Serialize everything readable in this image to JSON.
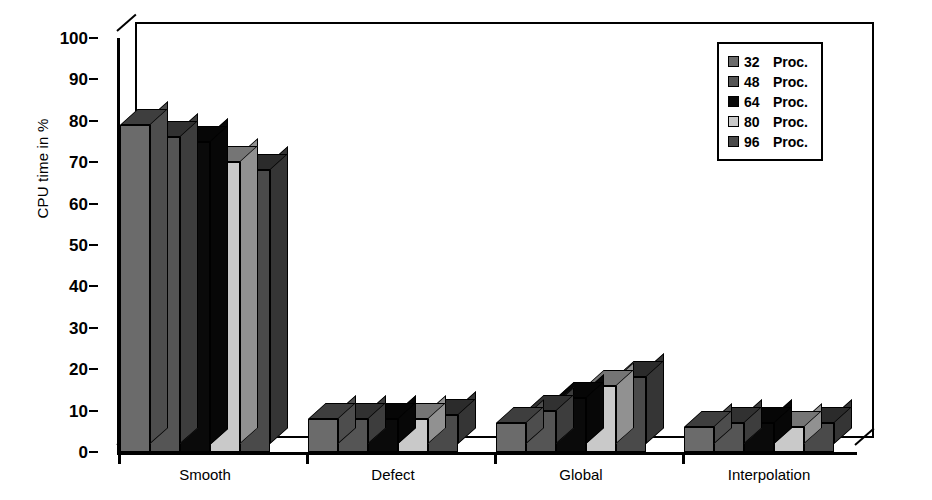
{
  "chart_data": {
    "type": "bar",
    "title": "",
    "subtitle": "",
    "xlabel": "",
    "ylabel": "CPU time in %",
    "ylim": [
      0,
      100
    ],
    "yticks": [
      0,
      10,
      20,
      30,
      40,
      50,
      60,
      70,
      80,
      90,
      100
    ],
    "ytick_labels": [
      "0",
      "10",
      "20",
      "30",
      "40",
      "50",
      "60",
      "70",
      "80",
      "90",
      "100"
    ],
    "grid": false,
    "style_3d": true,
    "legend_position": "top-right",
    "categories": [
      "Smooth",
      "Defect",
      "Global",
      "Interpolation"
    ],
    "series": [
      {
        "name": "32 Proc.",
        "color": "#6b6b6b",
        "values": [
          79,
          8,
          7,
          6
        ]
      },
      {
        "name": "48 Proc.",
        "color": "#555555",
        "values": [
          76,
          8,
          10,
          7
        ]
      },
      {
        "name": "64 Proc.",
        "color": "#0a0a0a",
        "values": [
          75,
          8,
          13,
          7
        ]
      },
      {
        "name": "80 Proc.",
        "color": "#c9c9c9",
        "values": [
          70,
          8,
          16,
          6
        ]
      },
      {
        "name": "96 Proc.",
        "color": "#4a4a4a",
        "values": [
          68,
          9,
          18,
          7
        ]
      }
    ],
    "annotations": []
  },
  "legend": {
    "entries": [
      {
        "number": "32",
        "unit": "Proc.",
        "swatch": "#6b6b6b"
      },
      {
        "number": "48",
        "unit": "Proc.",
        "swatch": "#555555"
      },
      {
        "number": "64",
        "unit": "Proc.",
        "swatch": "#0a0a0a"
      },
      {
        "number": "80",
        "unit": "Proc.",
        "swatch": "#c9c9c9"
      },
      {
        "number": "96",
        "unit": "Proc.",
        "swatch": "#4a4a4a"
      }
    ]
  },
  "colors": {
    "axis": "#000000",
    "background": "#ffffff",
    "side_shade": "#3a3a3a",
    "top_shade": "#2e2e2e"
  }
}
